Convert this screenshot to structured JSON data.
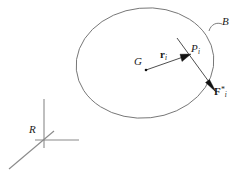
{
  "figure": {
    "type": "free-body-diagram",
    "background_color": "#ffffff",
    "stroke_color": "#6e6e6e",
    "text_color": "#1a1a1a",
    "labels": {
      "body": "B",
      "mass_center": "G",
      "position_vector": "r",
      "position_vector_sub": "i",
      "point": "P",
      "point_sub": "i",
      "force": "F",
      "force_sup": "*",
      "force_sub": "i",
      "frame": "R"
    }
  },
  "geometry": {
    "ellipse": {
      "cx": 145,
      "cy": 63,
      "rx": 69,
      "ry": 55,
      "rotation_deg": -6
    },
    "mass_center_point": {
      "x": 146,
      "y": 70
    },
    "boundary_point": {
      "x": 191,
      "y": 54
    },
    "position_vector": {
      "x1": 146,
      "y1": 70,
      "x2": 189,
      "y2": 55
    },
    "force_line": {
      "x1": 177,
      "y1": 38,
      "x2": 216,
      "y2": 92
    },
    "body_leader": {
      "x1": 210,
      "y1": 30,
      "x2": 222,
      "y2": 22
    },
    "frame_origin": {
      "x": 44,
      "y": 140
    },
    "frame_axes": [
      {
        "name": "vertical-axis",
        "x2": 44,
        "y2": 99
      },
      {
        "name": "horizontal-axis",
        "x2": 79,
        "y2": 140
      },
      {
        "name": "diagonal-axis",
        "x2": 9,
        "y2": 169
      }
    ]
  }
}
